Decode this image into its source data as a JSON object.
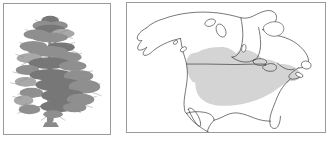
{
  "figure": {
    "type": "two-panel-species-plate",
    "background_color": "#ffffff",
    "panel_border_color": "#9a9a9a",
    "panel_count": "2"
  },
  "panels": {
    "tree": {
      "name": "tree-illustration-panel",
      "subject": "pine-tree-silhouette",
      "description": "Grayscale halftone illustration of a mature conifer (pine) tree with an irregular open crown, tiered horizontal branches and a single straight trunk",
      "ink_color": "#8f8f8f",
      "fill_color": "#ffffff",
      "label": ""
    },
    "map": {
      "name": "distribution-map-panel",
      "subject": "north-america-range-map",
      "description": "Outline map of North America showing Alaska, Canada, Hudson Bay, the contiguous United States, Baja California and northern Mexico, with a shaded natural distribution range",
      "outline_color": "#3a3a3a",
      "land_fill": "#ffffff",
      "range_fill": "#d4d4d4",
      "label": ""
    }
  },
  "map_features": {
    "outlines": [
      "alaska",
      "canada-mainland",
      "hudson-bay",
      "baffin-island",
      "victoria-island",
      "banks-island",
      "newfoundland",
      "great-lakes",
      "contiguous-united-states",
      "baja-california",
      "mexico-northern",
      "florida-peninsula",
      "vancouver-island",
      "queen-charlotte-islands",
      "nova-scotia"
    ],
    "border_lines": [
      "usa-canada-49th-parallel",
      "usa-mexico-border"
    ],
    "range_shading": {
      "name": "species-distribution-range",
      "color": "#d4d4d4",
      "extent": "Central and eastern United States extending north-west into south-central Canada (Alberta, Saskatchewan, Manitoba) and east to the Atlantic seaboard and Great Lakes region"
    }
  }
}
